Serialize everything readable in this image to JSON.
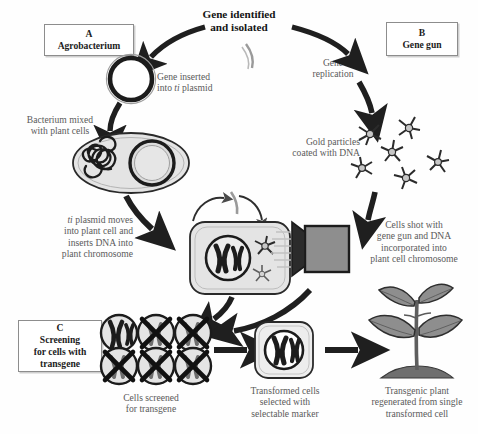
{
  "diagram": {
    "title": "Gene identified\nand isolated",
    "title_line1": "Gene identified",
    "title_line2": "and isolated",
    "panels": [
      {
        "id": "A",
        "letter": "A",
        "name": "Agrobacterium"
      },
      {
        "id": "B",
        "letter": "B",
        "name": "Gene gun"
      },
      {
        "id": "C",
        "letter": "C",
        "name": "Screening\nfor cells with\ntransgene",
        "name_line1": "Screening",
        "name_line2": "for cells with",
        "name_line3": "transgene"
      }
    ],
    "captions": {
      "gene_inserted": {
        "line1": "Gene inserted",
        "line2_pre": "into ",
        "line2_ital": "ti",
        "line2_post": " plasmid"
      },
      "gene_replication": {
        "line1": "Gene",
        "line2": "replication"
      },
      "bacterium_mixed": {
        "line1": "Bacterium mixed",
        "line2": "with plant cells"
      },
      "gold_particles": {
        "line1": "Gold particles",
        "line2": "coated with DNA"
      },
      "ti_plasmid_moves": {
        "line1_ital": "ti",
        "line1_post": " plasmid moves",
        "line2": "into plant cell and",
        "line3": "inserts DNA into",
        "line4": "plant chromosome"
      },
      "cells_shot": {
        "line1": "Cells shot with",
        "line2": "gene gun and DNA",
        "line3": "incorporated into",
        "line4": "plant cell chromosome"
      },
      "cells_screened": {
        "line1": "Cells screened",
        "line2": "for transgene"
      },
      "transformed_cells": {
        "line1": "Transformed cells",
        "line2": "selected with",
        "line3": "selectable marker"
      },
      "transgenic_plant": {
        "line1": "Transgenic plant",
        "line2": "regenerated from single",
        "line3": "transformed cell"
      }
    },
    "icon_names": [
      "ti-plasmid-ring-icon",
      "agrobacterium-cell-icon",
      "gold-particle-icon",
      "plant-cell-icon",
      "gene-gun-icon",
      "screened-cell-icon",
      "transformed-cell-icon",
      "transgenic-plant-icon",
      "gene-fragment-icon",
      "flow-arrow-icon"
    ],
    "colors": {
      "ink": "#1c1c1c",
      "caption_text": "#5a5a5a",
      "arrow": "#1f1f1f",
      "cell_fill": "#e4e4e4",
      "cell_stroke": "#2a2a2a",
      "gun_fill": "#8e8e8e",
      "gun_nozzle": "#2b2b2b",
      "leaf_fill": "#8e8e8e",
      "soil_fill": "#6f6f6f",
      "box_border": "#8d8d8d",
      "background": "#fefefe"
    }
  }
}
